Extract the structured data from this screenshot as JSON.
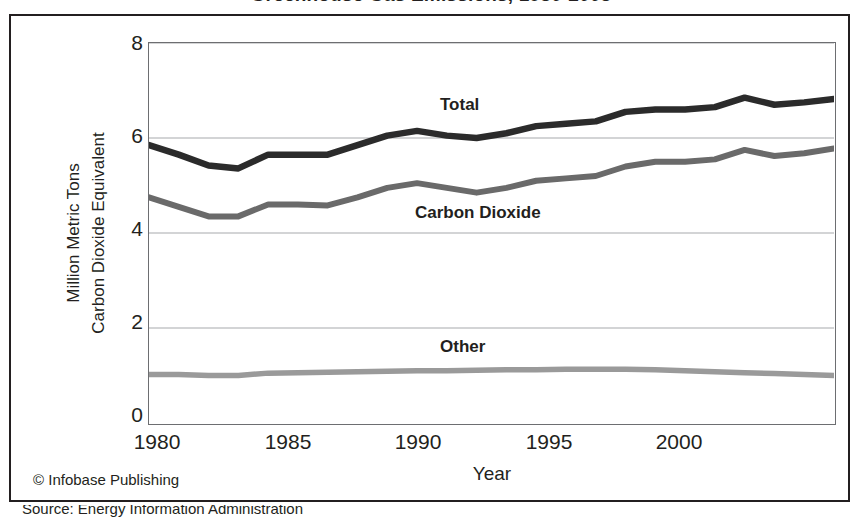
{
  "figure": {
    "title": "Greenhouse Gas Emissions, 1980-2003",
    "credit": "© Infobase Publishing",
    "source_note": "Source: Energy Information Administration"
  },
  "axes": {
    "y_title_line1": "Million Metric Tons",
    "y_title_line2": "Carbon Dioxide Equivalent",
    "x_title": "Year",
    "y_ticks": [
      "0",
      "2",
      "4",
      "6",
      "8"
    ],
    "x_ticks": [
      "1980",
      "1985",
      "1990",
      "1995",
      "2000"
    ]
  },
  "labels": {
    "total": "Total",
    "carbon_dioxide": "Carbon Dioxide",
    "other": "Other"
  },
  "colors": {
    "total": "#2b2b2b",
    "carbon_dioxide": "#6a6a6a",
    "other": "#9a9a9a",
    "grid": "#a7a9ac",
    "axis": "#6d6e71",
    "frame": "#231f20",
    "text": "#231f20",
    "background": "#ffffff"
  },
  "chart_data": {
    "type": "line",
    "title": "Greenhouse Gas Emissions, 1980-2003",
    "xlabel": "Year",
    "ylabel": "Million Metric Tons Carbon Dioxide Equivalent",
    "xlim": [
      1980,
      2003
    ],
    "ylim": [
      0,
      8
    ],
    "yticks": [
      0,
      2,
      4,
      6,
      8
    ],
    "xticks": [
      1980,
      1985,
      1990,
      1995,
      2000
    ],
    "grid": true,
    "legend": "inline-annotations",
    "x": [
      1980,
      1981,
      1982,
      1983,
      1984,
      1985,
      1986,
      1987,
      1988,
      1989,
      1990,
      1991,
      1992,
      1993,
      1994,
      1995,
      1996,
      1997,
      1998,
      1999,
      2000,
      2001,
      2002,
      2003
    ],
    "series": [
      {
        "name": "Total",
        "color": "#2b2b2b",
        "values": [
          5.85,
          5.65,
          5.42,
          5.36,
          5.65,
          5.65,
          5.65,
          5.85,
          6.05,
          6.15,
          6.05,
          6.0,
          6.1,
          6.25,
          6.3,
          6.35,
          6.55,
          6.6,
          6.6,
          6.65,
          6.85,
          6.7,
          6.75,
          6.82
        ]
      },
      {
        "name": "Carbon Dioxide",
        "color": "#6a6a6a",
        "values": [
          4.75,
          4.55,
          4.35,
          4.35,
          4.6,
          4.6,
          4.58,
          4.75,
          4.95,
          5.05,
          4.95,
          4.85,
          4.95,
          5.1,
          5.15,
          5.2,
          5.4,
          5.5,
          5.5,
          5.55,
          5.75,
          5.62,
          5.68,
          5.78
        ]
      },
      {
        "name": "Other",
        "color": "#9a9a9a",
        "values": [
          1.02,
          1.02,
          1.0,
          1.0,
          1.05,
          1.06,
          1.07,
          1.08,
          1.09,
          1.1,
          1.1,
          1.11,
          1.12,
          1.12,
          1.13,
          1.13,
          1.13,
          1.12,
          1.1,
          1.08,
          1.06,
          1.04,
          1.02,
          1.0
        ]
      }
    ],
    "annotations": [
      {
        "text": "Total",
        "x": 1989,
        "y": 6.75
      },
      {
        "text": "Carbon Dioxide",
        "x": 1991.5,
        "y": 4.45
      },
      {
        "text": "Other",
        "x": 1990,
        "y": 1.65
      }
    ]
  }
}
